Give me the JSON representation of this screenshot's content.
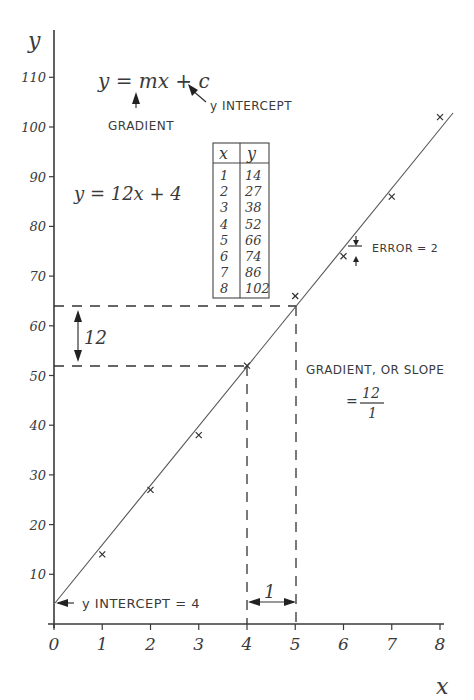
{
  "chart_data": {
    "type": "scatter",
    "title": "",
    "xlabel": "x",
    "ylabel": "y",
    "xlim": [
      0,
      8
    ],
    "ylim": [
      0,
      110
    ],
    "x_ticks": [
      "0",
      "1",
      "2",
      "3",
      "4",
      "5",
      "6",
      "7",
      "8"
    ],
    "y_ticks": [
      "10",
      "20",
      "30",
      "40",
      "50",
      "60",
      "70",
      "80",
      "90",
      "100",
      "110"
    ],
    "grid": false,
    "series": [
      {
        "name": "data",
        "x": [
          1,
          2,
          3,
          4,
          5,
          6,
          7,
          8
        ],
        "y": [
          14,
          27,
          38,
          52,
          66,
          74,
          86,
          102
        ]
      }
    ],
    "fit_line": {
      "equation": "y = 12x + 4",
      "gradient": 12,
      "intercept": 4
    },
    "table": {
      "headers": [
        "x",
        "y"
      ],
      "rows": [
        [
          "1",
          "14"
        ],
        [
          "2",
          "27"
        ],
        [
          "3",
          "38"
        ],
        [
          "4",
          "52"
        ],
        [
          "5",
          "66"
        ],
        [
          "6",
          "74"
        ],
        [
          "7",
          "86"
        ],
        [
          "8",
          "102"
        ]
      ]
    },
    "annotations": {
      "general_form": "y = mx + c",
      "gradient_label": "GRADIENT",
      "intercept_label": "y INTERCEPT",
      "fit_equation": "y = 12x + 4",
      "rise_label": "12",
      "run_label": "1",
      "slope_text": "GRADIENT, OR SLOPE",
      "slope_numerator": "12",
      "slope_denominator": "1",
      "slope_equals": "=",
      "error_label": "ERROR = 2",
      "intercept_note": "y INTERCEPT = 4"
    }
  }
}
